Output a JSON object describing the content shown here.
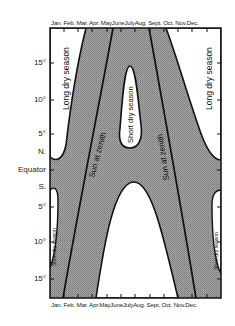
{
  "diagram": {
    "months": [
      "Jan.",
      "Feb.",
      "Mar.",
      "Apr.",
      "May",
      "June",
      "July",
      "Aug.",
      "Sept.",
      "Oct.",
      "Nov.",
      "Dec."
    ],
    "latitude_labels": [
      {
        "label": "15°",
        "y": 63
      },
      {
        "label": "10°",
        "y": 100
      },
      {
        "label": "5°",
        "y": 134
      },
      {
        "label": "N.",
        "y": 152
      },
      {
        "label": "Equator",
        "y": 170
      },
      {
        "label": "S.",
        "y": 187
      },
      {
        "label": "5°",
        "y": 207
      },
      {
        "label": "10°",
        "y": 242
      },
      {
        "label": "15°",
        "y": 279
      }
    ],
    "regions": {
      "long_dry_season_nw": "Long dry season",
      "long_dry_season_ne": "Long dry season",
      "short_dry_season_north_center": "Short dry season",
      "long_dry_season_south_center": "Long dry season",
      "short_dry_season_sw": "Short dry season",
      "short_dry_season_se": "Short dry season"
    },
    "lines": {
      "sun_zenith_left": "Sun at zenith",
      "sun_zenith_right": "Sun at zenith"
    },
    "colors": {
      "wet_fill": "#9a9a9a",
      "dry_fill": "#ffffff",
      "line": "#111111"
    }
  }
}
